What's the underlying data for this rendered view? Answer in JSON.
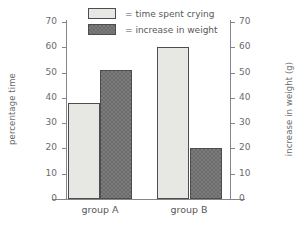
{
  "chart_data": {
    "type": "bar",
    "title": "",
    "xlabel": "",
    "ylabel": "percentage time",
    "ylabel_right": "increase in weight (g)",
    "categories": [
      "group A",
      "group B"
    ],
    "series": [
      {
        "name": "= time spent crying",
        "values": [
          38,
          60
        ],
        "color": "#e7e7e4",
        "axis": "left"
      },
      {
        "name": "= increase in weight",
        "values": [
          51,
          20
        ],
        "color": "#6c6c6c",
        "axis": "right"
      }
    ],
    "ylim": [
      0,
      70
    ],
    "ylim_right": [
      0,
      70
    ],
    "yticks": [
      0,
      10,
      20,
      30,
      40,
      50,
      60,
      70
    ],
    "yticks_right": [
      0,
      10,
      20,
      30,
      40,
      50,
      60,
      70
    ],
    "ytick_labels": [
      "0",
      "10",
      "20",
      "30",
      "40",
      "50",
      "60",
      "70"
    ],
    "ytick_labels_right": [
      "0",
      "10",
      "20",
      "30",
      "40",
      "50",
      "60",
      "70"
    ],
    "grid": false,
    "legend_position": "top-center"
  },
  "legend": {
    "items": [
      {
        "label": "= time spent crying",
        "swatch": "light-swatch-icon"
      },
      {
        "label": "= increase in weight",
        "swatch": "dark-swatch-icon"
      }
    ]
  },
  "axes": {
    "left_title": "percentage time",
    "right_title": "increase in weight (g)"
  }
}
